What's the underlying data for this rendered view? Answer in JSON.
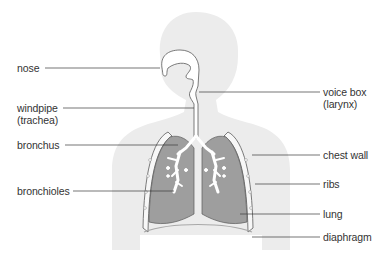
{
  "diagram": {
    "colors": {
      "background": "#ffffff",
      "silhouette": "#ececec",
      "lung": "#9e9e9e",
      "airway": "#ffffff",
      "outline": "#5a5a5a",
      "leader_line": "#3a3a3a",
      "label_text": "#333333"
    },
    "labels_left": [
      {
        "id": "nose",
        "text": "nose",
        "sub": ""
      },
      {
        "id": "windpipe",
        "text": "windpipe",
        "sub": "(trachea)"
      },
      {
        "id": "bronchus",
        "text": "bronchus",
        "sub": ""
      },
      {
        "id": "bronchioles",
        "text": "bronchioles",
        "sub": ""
      }
    ],
    "labels_right": [
      {
        "id": "voice-box",
        "text": "voice box",
        "sub": "(larynx)"
      },
      {
        "id": "chest-wall",
        "text": "chest wall",
        "sub": ""
      },
      {
        "id": "ribs",
        "text": "ribs",
        "sub": ""
      },
      {
        "id": "lung",
        "text": "lung",
        "sub": ""
      },
      {
        "id": "diaphragm",
        "text": "diaphragm",
        "sub": ""
      }
    ]
  }
}
